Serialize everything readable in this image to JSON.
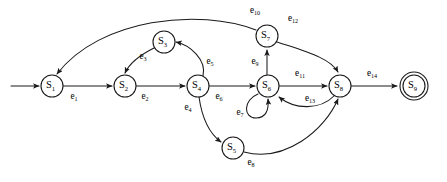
{
  "diagram": {
    "type": "finite-state-machine",
    "background_color": "#ffffff",
    "stroke_color": "#1a1a1a",
    "start_marker": "start-arrow",
    "states": [
      {
        "id": "S1",
        "letter": "S",
        "sub": "1",
        "cx": 52,
        "cy": 86,
        "r": 11,
        "accepting": false
      },
      {
        "id": "S2",
        "letter": "S",
        "sub": "2",
        "cx": 125,
        "cy": 86,
        "r": 11,
        "accepting": false
      },
      {
        "id": "S3",
        "letter": "S",
        "sub": "3",
        "cx": 164,
        "cy": 42,
        "r": 11,
        "accepting": false
      },
      {
        "id": "S4",
        "letter": "S",
        "sub": "4",
        "cx": 198,
        "cy": 86,
        "r": 11,
        "accepting": false
      },
      {
        "id": "S5",
        "letter": "S",
        "sub": "5",
        "cx": 233,
        "cy": 148,
        "r": 11,
        "accepting": false
      },
      {
        "id": "S6",
        "letter": "S",
        "sub": "6",
        "cx": 268,
        "cy": 86,
        "r": 11,
        "accepting": false
      },
      {
        "id": "S7",
        "letter": "S",
        "sub": "7",
        "cx": 267,
        "cy": 36,
        "r": 11,
        "accepting": false
      },
      {
        "id": "S8",
        "letter": "S",
        "sub": "8",
        "cx": 340,
        "cy": 86,
        "r": 11,
        "accepting": false
      },
      {
        "id": "S9",
        "letter": "S",
        "sub": "9",
        "cx": 414,
        "cy": 86,
        "r": 11,
        "accepting": true,
        "outer_r": 14
      }
    ],
    "transitions": [
      {
        "id": "e1",
        "letter": "e",
        "sub": "1",
        "from": "S1",
        "to": "S2",
        "label_x": 74,
        "label_y": 97,
        "path": "M 63 86 L 112 86"
      },
      {
        "id": "e2",
        "letter": "e",
        "sub": "2",
        "from": "S2",
        "to": "S4",
        "label_x": 145,
        "label_y": 97,
        "path": "M 136 86 L 185 86"
      },
      {
        "id": "e3",
        "letter": "e",
        "sub": "3",
        "from": "S3",
        "to": "S2",
        "label_x": 143,
        "label_y": 57,
        "path": "M 154 48 C 140 55 130 62 125 73"
      },
      {
        "id": "e4",
        "letter": "e",
        "sub": "4",
        "from": "S4",
        "to": "S5",
        "label_x": 188,
        "label_y": 108,
        "path": "M 199 97 C 202 118 210 134 221 142"
      },
      {
        "id": "e5",
        "letter": "e",
        "sub": "5",
        "from": "S4",
        "to": "S3",
        "label_x": 210,
        "label_y": 62,
        "path": "M 203 76 C 207 60 190 45 176 42"
      },
      {
        "id": "e6",
        "letter": "e",
        "sub": "6",
        "from": "S4",
        "to": "S6",
        "label_x": 219,
        "label_y": 97,
        "path": "M 209 86 L 255 86"
      },
      {
        "id": "e7",
        "letter": "e",
        "sub": "7",
        "from": "S6",
        "to": "S6",
        "label_x": 240,
        "label_y": 113,
        "path": "M 258 94 C 243 100 243 118 256 118 C 266 118 269 110 268 99"
      },
      {
        "id": "e8",
        "letter": "e",
        "sub": "8",
        "from": "S5",
        "to": "S8",
        "label_x": 251,
        "label_y": 163,
        "path": "M 244 152 C 285 163 325 130 338 99"
      },
      {
        "id": "e9",
        "letter": "e",
        "sub": "9",
        "from": "S6",
        "to": "S7",
        "label_x": 255,
        "label_y": 62,
        "path": "M 267 75 L 267 50"
      },
      {
        "id": "e10",
        "letter": "e",
        "sub": "10",
        "from": "S7",
        "to": "S1",
        "label_x": 255,
        "label_y": 11,
        "path": "M 256 30 C 200 8 100 18 57 74"
      },
      {
        "id": "e11",
        "letter": "e",
        "sub": "11",
        "from": "S6",
        "to": "S8",
        "label_x": 300,
        "label_y": 74,
        "path": "M 279 86 L 327 86"
      },
      {
        "id": "e12",
        "letter": "e",
        "sub": "12",
        "from": "S7",
        "to": "S8",
        "label_x": 293,
        "label_y": 19,
        "path": "M 277 42 C 307 52 330 58 338 72"
      },
      {
        "id": "e13",
        "letter": "e",
        "sub": "13",
        "from": "S8",
        "to": "S6",
        "label_x": 310,
        "label_y": 99,
        "path": "M 334 96 C 320 110 295 110 279 97"
      },
      {
        "id": "e14",
        "letter": "e",
        "sub": "14",
        "from": "S8",
        "to": "S9",
        "label_x": 372,
        "label_y": 74,
        "path": "M 351 86 L 397 86"
      }
    ],
    "start_arrow": {
      "path": "M 11 86 L 39 86"
    }
  }
}
